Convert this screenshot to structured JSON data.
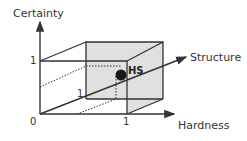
{
  "diagram": {
    "axes": {
      "y_label": "Certainty",
      "x_label": "Hardness",
      "z_label": "Structure"
    },
    "ticks": {
      "origin": "0",
      "x_one": "1",
      "y_one": "1",
      "z_one": "1"
    },
    "point": {
      "label": "HS",
      "description": "point near (1,1,1) corner of unit cube"
    },
    "colors": {
      "line": "#333333",
      "shaded_face": "#e0e0e0",
      "point": "#1a1a1a"
    }
  }
}
